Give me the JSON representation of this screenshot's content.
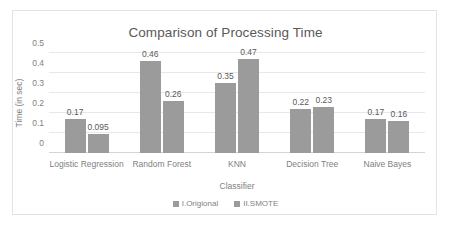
{
  "chart_data": {
    "type": "bar",
    "title": "Comparison of Processing Time",
    "xlabel": "Classifier",
    "ylabel": "Time (in sec)",
    "categories": [
      "Logistic Regression",
      "Random Forest",
      "KNN",
      "Decision Tree",
      "Naive Bayes"
    ],
    "series": [
      {
        "name": "I.Origional",
        "values": [
          0.17,
          0.46,
          0.35,
          0.22,
          0.17
        ],
        "labels": [
          "0.17",
          "0.46",
          "0.35",
          "0.22",
          "0.17"
        ],
        "color": "#9b9b9b"
      },
      {
        "name": "II.SMOTE",
        "values": [
          0.095,
          0.26,
          0.47,
          0.23,
          0.16
        ],
        "labels": [
          "0.095",
          "0.26",
          "0.47",
          "0.23",
          "0.16"
        ],
        "color": "#9b9b9b"
      }
    ],
    "ylim": [
      0,
      0.5
    ],
    "yticks": [
      "0",
      "0.1",
      "0.2",
      "0.3",
      "0.4",
      "0.5"
    ],
    "ytick_values": [
      0,
      0.1,
      0.2,
      0.3,
      0.4,
      0.5
    ],
    "grid": true,
    "legend_position": "bottom",
    "title_color": "#595959",
    "axis_text_color": "#7f7f7f",
    "gridline_color": "#e8e8e8",
    "border_color": "#e3e3e3",
    "background": "#ffffff"
  }
}
